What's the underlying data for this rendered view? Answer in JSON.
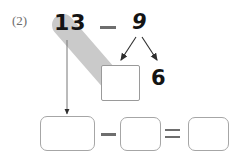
{
  "worksheet": {
    "problem_label": "(2)",
    "expression": {
      "minuend": "13",
      "operator_top": "−",
      "subtrahend": "9"
    },
    "decomposition": {
      "source_value": "9",
      "left_part_value": "",
      "left_part_placeholder": "",
      "right_part_value": "6"
    },
    "answer_row": {
      "box_1_value": "",
      "minus_sign": "−",
      "box_2_value": "",
      "equals_sign": "=",
      "box_3_value": ""
    },
    "annotations": {
      "highlight_band_label": "gray-highlight-band",
      "arrow_13_to_box1_label": "arrow-down",
      "arrow_9_left_label": "arrow-branch-left",
      "arrow_9_right_label": "arrow-branch-right"
    },
    "colors": {
      "ink": "#141414",
      "label_gray": "#6d6d6d",
      "box_border": "#9a9a9a",
      "highlight": "#cacaca",
      "arrow": "#3a3a3a"
    }
  }
}
